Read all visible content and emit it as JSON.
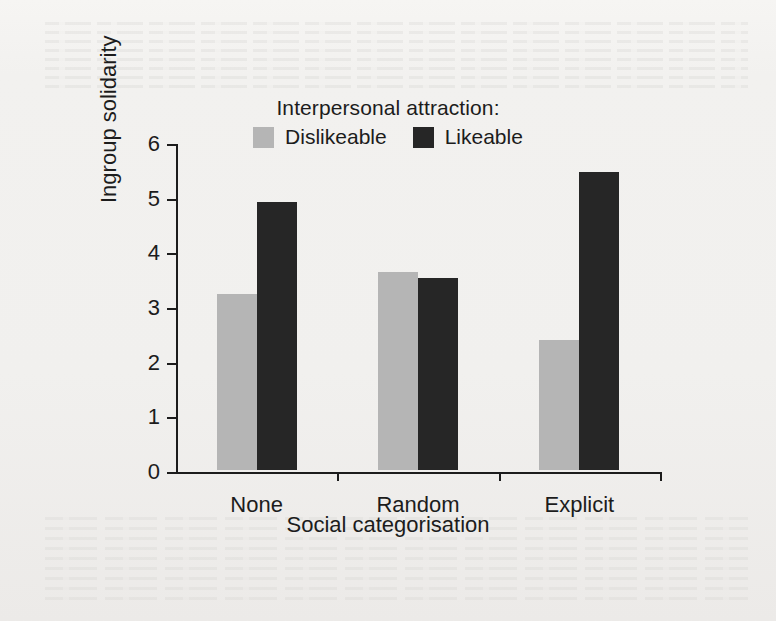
{
  "chart_data": {
    "type": "bar",
    "title": "",
    "legend_title": "Interpersonal attraction:",
    "legend_position": "top-center",
    "categories": [
      "None",
      "Random",
      "Explicit"
    ],
    "series": [
      {
        "name": "Dislikeable",
        "color": "#b5b5b5",
        "values": [
          3.22,
          3.62,
          2.37
        ]
      },
      {
        "name": "Likeable",
        "color": "#262626",
        "values": [
          4.9,
          3.52,
          5.45
        ]
      }
    ],
    "xlabel": "Social categorisation",
    "ylabel": "Ingroup solidarity",
    "ylim": [
      0,
      6
    ],
    "yticks": [
      0,
      1,
      2,
      3,
      4,
      5,
      6
    ],
    "ytick_labels": [
      "0",
      "1",
      "2",
      "3",
      "4",
      "5",
      "6"
    ],
    "grid": false
  },
  "colors": {
    "dislikeable": "#b5b5b5",
    "likeable": "#262626",
    "axis": "#1c1c1c",
    "page_background": "#f2f1ef"
  }
}
